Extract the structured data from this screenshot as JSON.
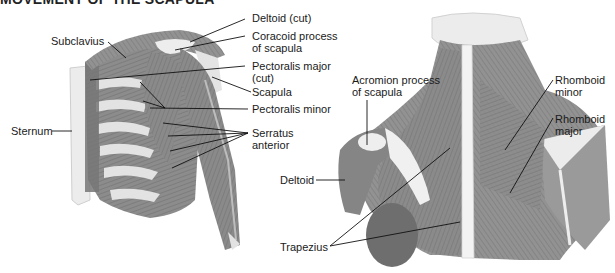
{
  "title": "MOVEMENT OF THE SCAPULA",
  "colors": {
    "muscle_dark": "#7a7a7a",
    "muscle_mid": "#8f8f8f",
    "muscle_light": "#a8a8a8",
    "bone": "#e6e6e6",
    "tendon": "#f2f2f2",
    "leader": "#111111",
    "background": "#ffffff"
  },
  "anterior_view": {
    "labels": [
      {
        "id": "subclavius",
        "text": "Subclavius"
      },
      {
        "id": "deltoid-cut",
        "text": "Deltoid (cut)"
      },
      {
        "id": "coracoid",
        "text": "Coracoid process\nof scapula"
      },
      {
        "id": "pec-major-cut",
        "text": "Pectoralis major\n(cut)"
      },
      {
        "id": "scapula",
        "text": "Scapula"
      },
      {
        "id": "pec-minor",
        "text": "Pectoralis minor"
      },
      {
        "id": "serratus",
        "text": "Serratus\nanterior"
      },
      {
        "id": "sternum",
        "text": "Sternum"
      }
    ]
  },
  "posterior_view": {
    "labels": [
      {
        "id": "acromion",
        "text": "Acromion process\nof scapula"
      },
      {
        "id": "rhomboid-minor",
        "text": "Rhomboid\nminor"
      },
      {
        "id": "rhomboid-major",
        "text": "Rhomboid\nmajor"
      },
      {
        "id": "deltoid",
        "text": "Deltoid"
      },
      {
        "id": "trapezius",
        "text": "Trapezius"
      }
    ]
  }
}
